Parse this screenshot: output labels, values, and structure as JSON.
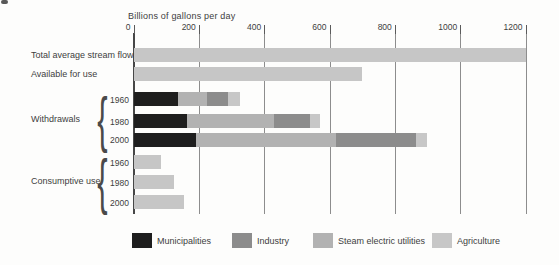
{
  "title": "Billions of gallons per day",
  "chart_data": {
    "type": "bar",
    "orientation": "horizontal",
    "title": "Billions of gallons per day",
    "x_axis": {
      "min": 0,
      "max": 1200,
      "ticks": [
        0,
        200,
        400,
        600,
        800,
        1000,
        1200
      ],
      "gridlines": true
    },
    "groups": [
      {
        "label": "Withdrawals"
      },
      {
        "label": "Consumptive use"
      }
    ],
    "legend": [
      {
        "key": "municipalities",
        "label": "Municipalities",
        "color": "#1e1e1e"
      },
      {
        "key": "industry",
        "label": "Industry",
        "color": "#8c8c8c"
      },
      {
        "key": "steam",
        "label": "Steam electric utilities",
        "color": "#b2b2b2"
      },
      {
        "key": "agriculture",
        "label": "Agriculture",
        "color": "#c7c7c7"
      }
    ],
    "plain_bar_color": "#c6c6c6",
    "rows": [
      {
        "label": "Total average stream flow",
        "group": null,
        "segments": [
          {
            "category": "plain",
            "value": 1200
          }
        ],
        "total": 1200
      },
      {
        "label": "Available for use",
        "group": null,
        "segments": [
          {
            "category": "plain",
            "value": 700
          }
        ],
        "total": 700
      },
      {
        "label": "1960",
        "group": "Withdrawals",
        "segments": [
          {
            "category": "municipalities",
            "value": 135
          },
          {
            "category": "steam",
            "value": 90
          },
          {
            "category": "industry",
            "value": 65
          },
          {
            "category": "agriculture",
            "value": 35
          }
        ],
        "total": 325
      },
      {
        "label": "1980",
        "group": "Withdrawals",
        "segments": [
          {
            "category": "municipalities",
            "value": 165
          },
          {
            "category": "steam",
            "value": 265
          },
          {
            "category": "industry",
            "value": 110
          },
          {
            "category": "agriculture",
            "value": 30
          }
        ],
        "total": 570
      },
      {
        "label": "2000",
        "group": "Withdrawals",
        "segments": [
          {
            "category": "municipalities",
            "value": 190
          },
          {
            "category": "steam",
            "value": 430
          },
          {
            "category": "industry",
            "value": 245
          },
          {
            "category": "agriculture",
            "value": 35
          }
        ],
        "total": 900
      },
      {
        "label": "1960",
        "group": "Consumptive use",
        "segments": [
          {
            "category": "plain",
            "value": 85
          }
        ],
        "total": 85
      },
      {
        "label": "1980",
        "group": "Consumptive use",
        "segments": [
          {
            "category": "plain",
            "value": 125
          }
        ],
        "total": 125
      },
      {
        "label": "2000",
        "group": "Consumptive use",
        "segments": [
          {
            "category": "plain",
            "value": 155
          }
        ],
        "total": 155
      }
    ]
  }
}
